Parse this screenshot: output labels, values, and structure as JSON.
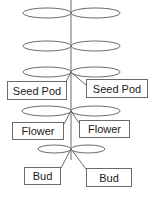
{
  "diagram": {
    "title": "",
    "colors": {
      "stroke": "#6a6a6a",
      "text": "#1a1a1a",
      "background": "#ffffff"
    },
    "labels": {
      "seed_pod_left": "Seed Pod",
      "seed_pod_right": "Seed Pod",
      "flower_left": "Flower",
      "flower_right": "Flower",
      "bud_left": "Bud",
      "bud_right": "Bud"
    }
  }
}
